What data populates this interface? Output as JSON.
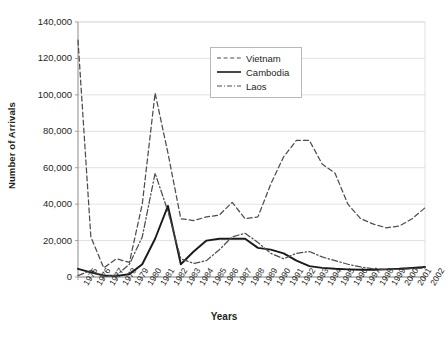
{
  "chart_data": {
    "type": "line",
    "title": "",
    "xlabel": "Years",
    "ylabel": "Number of Arrivals",
    "ylim": [
      0,
      140000
    ],
    "ytick_step": 20000,
    "grid": true,
    "legend_position": "top-center",
    "x": [
      1975,
      1976,
      1977,
      1978,
      1979,
      1980,
      1981,
      1982,
      1983,
      1984,
      1985,
      1986,
      1987,
      1988,
      1989,
      1990,
      1991,
      1992,
      1993,
      1994,
      1995,
      1996,
      1997,
      1998,
      1999,
      2000,
      2001,
      2002
    ],
    "categories": [
      "1975",
      "1976",
      "1977",
      "1978",
      "1979",
      "1980",
      "1981",
      "1982",
      "1983",
      "1984",
      "1985",
      "1986",
      "1987",
      "1988",
      "1989",
      "1990",
      "1991",
      "1992",
      "1993",
      "1994",
      "1995",
      "1996",
      "1997",
      "1998",
      "1999",
      "2000",
      "2001",
      "2002"
    ],
    "series": [
      {
        "name": "Vietnam",
        "style": "dashed",
        "color": "#4d4d4d",
        "values": [
          130000,
          22000,
          5000,
          10000,
          8000,
          40000,
          101000,
          68000,
          32000,
          31000,
          33000,
          34000,
          41000,
          32000,
          33000,
          51000,
          66000,
          75000,
          75000,
          62000,
          57000,
          40000,
          32000,
          29000,
          27000,
          28000,
          32000,
          38000
        ]
      },
      {
        "name": "Cambodia",
        "style": "solid",
        "color": "#1a1a1a",
        "values": [
          4500,
          2500,
          800,
          600,
          1500,
          7000,
          21000,
          39000,
          7000,
          14000,
          20000,
          21000,
          21000,
          21000,
          16000,
          15000,
          13000,
          9000,
          6000,
          5000,
          4500,
          4200,
          4000,
          4000,
          4200,
          4500,
          5000,
          5500
        ]
      },
      {
        "name": "Laos",
        "style": "dashdot",
        "color": "#4d4d4d",
        "values": [
          800,
          3500,
          400,
          1000,
          7000,
          22000,
          57000,
          36000,
          10000,
          7500,
          9000,
          15000,
          22000,
          24000,
          19000,
          13000,
          10000,
          13000,
          14000,
          11000,
          9000,
          7000,
          5500,
          4500,
          4200,
          4200,
          4500,
          5000
        ]
      }
    ]
  },
  "legend": {
    "items": [
      {
        "label": "Vietnam",
        "style": "dashed"
      },
      {
        "label": "Cambodia",
        "style": "solid"
      },
      {
        "label": "Laos",
        "style": "dashdot"
      }
    ]
  },
  "axes": {
    "y_ticks": [
      "0",
      "20,000",
      "40,000",
      "60,000",
      "80,000",
      "100,000",
      "120,000",
      "140,000"
    ]
  }
}
